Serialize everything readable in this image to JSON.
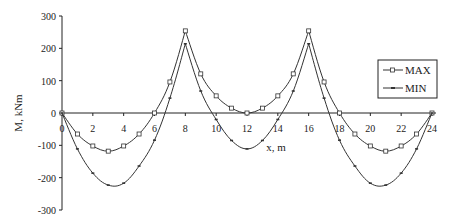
{
  "chart_data": {
    "type": "line",
    "title": "",
    "xlabel": "x, m",
    "ylabel": "M, kNm",
    "xlim": [
      0,
      24
    ],
    "ylim": [
      -300,
      300
    ],
    "x_ticks": [
      0,
      2,
      4,
      6,
      8,
      10,
      12,
      14,
      16,
      18,
      20,
      22,
      24
    ],
    "y_ticks": [
      300,
      200,
      100,
      0,
      -100,
      -200,
      -300
    ],
    "grid": false,
    "legend_position": "right",
    "x": [
      0,
      1,
      2,
      3,
      4,
      5,
      6,
      7,
      8,
      9,
      10,
      11,
      12,
      13,
      14,
      15,
      16,
      17,
      18,
      19,
      20,
      21,
      22,
      23,
      24
    ],
    "series": [
      {
        "name": "MAX",
        "marker": "square",
        "values": [
          0,
          -65,
          -102,
          -118,
          -102,
          -65,
          0,
          96,
          254,
          121,
          53,
          15,
          0,
          15,
          53,
          121,
          254,
          96,
          0,
          -65,
          -102,
          -118,
          -102,
          -65,
          0
        ]
      },
      {
        "name": "MIN",
        "marker": "dash",
        "values": [
          0,
          -111,
          -186,
          -223,
          -217,
          -164,
          -84,
          46,
          214,
          68,
          -20,
          -85,
          -111,
          -85,
          -20,
          68,
          214,
          46,
          -84,
          -164,
          -217,
          -223,
          -186,
          -111,
          0
        ]
      }
    ]
  },
  "legend": {
    "items": [
      {
        "label": "MAX"
      },
      {
        "label": "MIN"
      }
    ]
  },
  "axes": {
    "xlabel": "x, m",
    "ylabel": "M, kNm"
  }
}
